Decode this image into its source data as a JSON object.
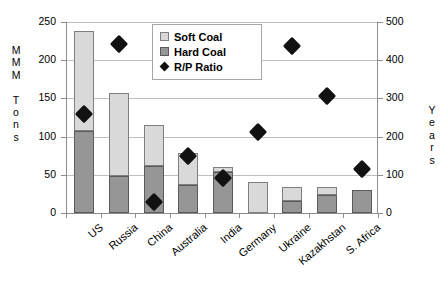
{
  "chart_data": {
    "type": "bar",
    "title": "",
    "xlabel": "",
    "ylabel": "M M M   T o n s",
    "y2label": "Y e a r s",
    "grid": true,
    "legend_position": "top-center-inside",
    "categories": [
      "US",
      "Russia",
      "China",
      "Australia",
      "India",
      "Germany",
      "Ukraine",
      "Kazakhstan",
      "S. Africa"
    ],
    "ylim": [
      0,
      250
    ],
    "yticks": [
      0,
      50,
      100,
      150,
      200,
      250
    ],
    "y2lim": [
      0,
      500
    ],
    "y2ticks": [
      0,
      100,
      200,
      300,
      400,
      500
    ],
    "series": [
      {
        "name": "Hard Coal",
        "axis": "left",
        "color": "#969696",
        "values": [
          108,
          49,
          62,
          37,
          54,
          0,
          16,
          24,
          30
        ]
      },
      {
        "name": "Soft Coal",
        "axis": "left",
        "color": "#d9d9d9",
        "values": [
          130,
          108,
          53,
          42,
          6,
          41,
          18,
          10,
          0
        ]
      },
      {
        "name": "R/P Ratio",
        "axis": "right",
        "marker": "diamond",
        "color": "#111111",
        "values": [
          258,
          443,
          28,
          148,
          92,
          212,
          437,
          307,
          114
        ]
      }
    ]
  },
  "axis": {
    "left_title_chars": [
      "M",
      "M",
      "M",
      "",
      "T",
      "o",
      "n",
      "s"
    ],
    "right_title_chars": [
      "Y",
      "e",
      "a",
      "r",
      "s"
    ],
    "left_ticks": [
      "250",
      "200",
      "150",
      "100",
      "50",
      "0"
    ],
    "right_ticks": [
      "500",
      "400",
      "300",
      "200",
      "100",
      "0"
    ]
  },
  "legend": {
    "items": [
      {
        "label": "Soft Coal",
        "swatch": "soft-coal-swatch"
      },
      {
        "label": "Hard Coal",
        "swatch": "hard-coal-swatch"
      },
      {
        "label": "R/P Ratio",
        "swatch": "rp-ratio-diamond"
      }
    ]
  }
}
